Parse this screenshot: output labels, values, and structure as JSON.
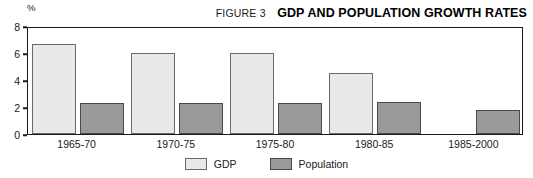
{
  "header": {
    "figure_label": "FIGURE 3",
    "title": "GDP AND POPULATION GROWTH RATES"
  },
  "axis": {
    "unit": "%"
  },
  "colors": {
    "gdp": "#e9e9e9",
    "population": "#9a9a9a",
    "frame": "#1a1a1a"
  },
  "chart_data": {
    "type": "bar",
    "title": "GDP AND POPULATION GROWTH RATES",
    "subtitle": "FIGURE 3",
    "xlabel": "",
    "ylabel": "%",
    "ylim": [
      0,
      8
    ],
    "yticks": [
      0,
      2,
      4,
      6,
      8
    ],
    "ytick_labels": [
      "0",
      "2",
      "4",
      "6",
      "8"
    ],
    "grid": false,
    "legend_position": "bottom-center",
    "categories": [
      "1965-70",
      "1970-75",
      "1975-80",
      "1980-85",
      "1985-2000"
    ],
    "series": [
      {
        "name": "GDP",
        "values": [
          6.7,
          6.0,
          6.0,
          4.5,
          null
        ]
      },
      {
        "name": "Population",
        "values": [
          2.3,
          2.3,
          2.3,
          2.4,
          1.8
        ]
      }
    ]
  }
}
